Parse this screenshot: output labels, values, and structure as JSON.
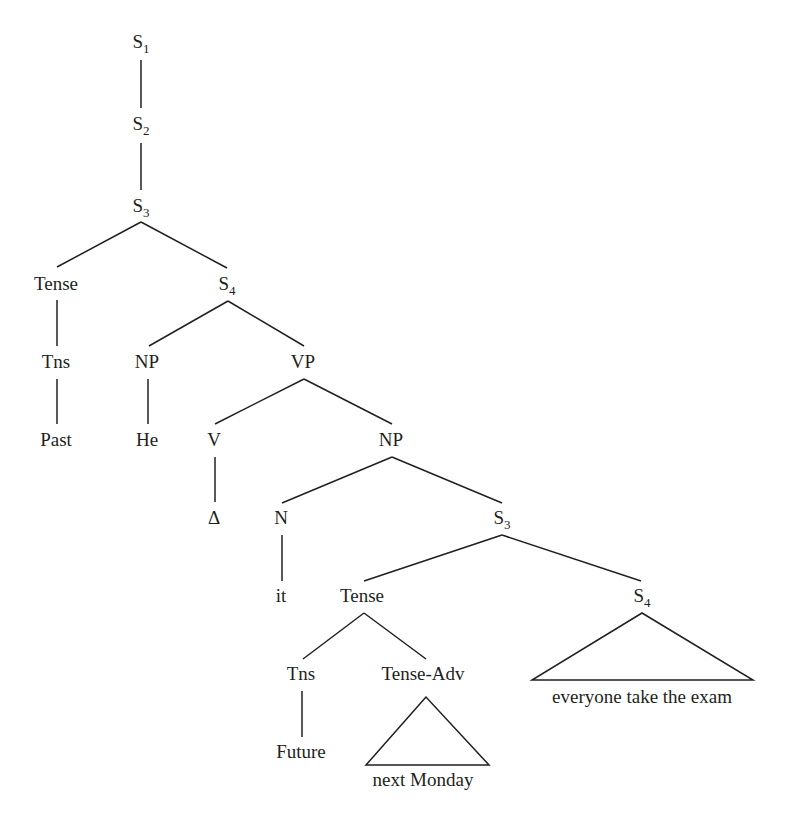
{
  "diagram": {
    "type": "syntax-tree",
    "stroke_color": "#231f20",
    "background": "#ffffff",
    "nodes": [
      {
        "id": "s1",
        "label": "S",
        "sub": "1",
        "x": 141,
        "y": 48
      },
      {
        "id": "s2",
        "label": "S",
        "sub": "2",
        "x": 141,
        "y": 130
      },
      {
        "id": "s3a",
        "label": "S",
        "sub": "3",
        "x": 141,
        "y": 212
      },
      {
        "id": "tense1",
        "label": "Tense",
        "sub": "",
        "x": 56,
        "y": 290
      },
      {
        "id": "s4a",
        "label": "S",
        "sub": "4",
        "x": 227,
        "y": 290
      },
      {
        "id": "tns1",
        "label": "Tns",
        "sub": "",
        "x": 56,
        "y": 368
      },
      {
        "id": "np1",
        "label": "NP",
        "sub": "",
        "x": 147,
        "y": 368
      },
      {
        "id": "vp",
        "label": "VP",
        "sub": "",
        "x": 303,
        "y": 368
      },
      {
        "id": "past",
        "label": "Past",
        "sub": "",
        "x": 56,
        "y": 446
      },
      {
        "id": "he",
        "label": "He",
        "sub": "",
        "x": 147,
        "y": 446
      },
      {
        "id": "v",
        "label": "V",
        "sub": "",
        "x": 214,
        "y": 446
      },
      {
        "id": "np2",
        "label": "NP",
        "sub": "",
        "x": 391,
        "y": 446
      },
      {
        "id": "delta",
        "label": "Δ",
        "sub": "",
        "x": 214,
        "y": 524
      },
      {
        "id": "n",
        "label": "N",
        "sub": "",
        "x": 281,
        "y": 524
      },
      {
        "id": "s3b",
        "label": "S",
        "sub": "3",
        "x": 502,
        "y": 524
      },
      {
        "id": "it",
        "label": "it",
        "sub": "",
        "x": 281,
        "y": 602
      },
      {
        "id": "tense2",
        "label": "Tense",
        "sub": "",
        "x": 362,
        "y": 602
      },
      {
        "id": "s4b",
        "label": "S",
        "sub": "4",
        "x": 642,
        "y": 602
      },
      {
        "id": "tns2",
        "label": "Tns",
        "sub": "",
        "x": 301,
        "y": 680
      },
      {
        "id": "tenseadv",
        "label": "Tense-Adv",
        "sub": "",
        "x": 423,
        "y": 680
      },
      {
        "id": "future",
        "label": "Future",
        "sub": "",
        "x": 301,
        "y": 758
      }
    ],
    "edges": [
      {
        "from": "s1",
        "to": "s2",
        "x1": 141,
        "y1": 60,
        "x2": 141,
        "y2": 108
      },
      {
        "from": "s2",
        "to": "s3a",
        "x1": 141,
        "y1": 143,
        "x2": 141,
        "y2": 190
      },
      {
        "from": "s3a",
        "to": "tense1",
        "x1": 141,
        "y1": 222,
        "x2": 57,
        "y2": 267
      },
      {
        "from": "s3a",
        "to": "s4a",
        "x1": 141,
        "y1": 222,
        "x2": 227,
        "y2": 268
      },
      {
        "from": "tense1",
        "to": "tns1",
        "x1": 57,
        "y1": 300,
        "x2": 57,
        "y2": 346
      },
      {
        "from": "s4a",
        "to": "np1",
        "x1": 228,
        "y1": 301,
        "x2": 149,
        "y2": 346
      },
      {
        "from": "s4a",
        "to": "vp",
        "x1": 228,
        "y1": 301,
        "x2": 304,
        "y2": 346
      },
      {
        "from": "tns1",
        "to": "past",
        "x1": 57,
        "y1": 379,
        "x2": 57,
        "y2": 424
      },
      {
        "from": "np1",
        "to": "he",
        "x1": 148,
        "y1": 379,
        "x2": 148,
        "y2": 424
      },
      {
        "from": "vp",
        "to": "v",
        "x1": 304,
        "y1": 379,
        "x2": 215,
        "y2": 424
      },
      {
        "from": "vp",
        "to": "np2",
        "x1": 304,
        "y1": 379,
        "x2": 392,
        "y2": 424
      },
      {
        "from": "v",
        "to": "delta",
        "x1": 215,
        "y1": 457,
        "x2": 215,
        "y2": 502
      },
      {
        "from": "np2",
        "to": "n",
        "x1": 392,
        "y1": 457,
        "x2": 282,
        "y2": 503
      },
      {
        "from": "np2",
        "to": "s3b",
        "x1": 392,
        "y1": 457,
        "x2": 502,
        "y2": 503
      },
      {
        "from": "n",
        "to": "it",
        "x1": 282,
        "y1": 535,
        "x2": 282,
        "y2": 581
      },
      {
        "from": "s3b",
        "to": "tense2",
        "x1": 502,
        "y1": 535,
        "x2": 364,
        "y2": 581
      },
      {
        "from": "s3b",
        "to": "s4b",
        "x1": 502,
        "y1": 535,
        "x2": 641,
        "y2": 581
      },
      {
        "from": "tense2",
        "to": "tns2",
        "x1": 364,
        "y1": 613,
        "x2": 303,
        "y2": 659
      },
      {
        "from": "tense2",
        "to": "tenseadv",
        "x1": 364,
        "y1": 613,
        "x2": 426,
        "y2": 659
      },
      {
        "from": "tns2",
        "to": "future",
        "x1": 302,
        "y1": 691,
        "x2": 302,
        "y2": 737
      }
    ],
    "triangles": [
      {
        "parent": "tenseadv",
        "label": "next Monday",
        "apex_x": 426,
        "apex_y": 697,
        "left_x": 366,
        "right_x": 489,
        "base_y": 765,
        "text_x": 423,
        "text_y": 786
      },
      {
        "parent": "s4b",
        "label": "everyone take the exam",
        "apex_x": 642,
        "apex_y": 613,
        "left_x": 532,
        "right_x": 753,
        "base_y": 680,
        "text_x": 642,
        "text_y": 703
      }
    ]
  }
}
